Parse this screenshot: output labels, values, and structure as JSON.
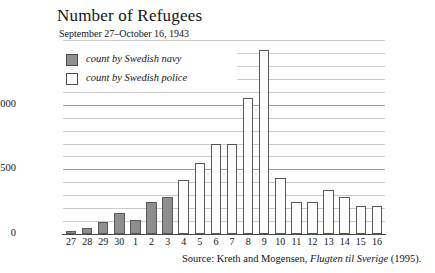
{
  "chart_data": {
    "type": "bar",
    "title": "Number of Refugees",
    "subtitle": "September 27–October 16, 1943",
    "xlabel": "",
    "ylabel": "",
    "ylim": [
      0,
      1500
    ],
    "ytick_values": [
      0,
      500,
      1000
    ],
    "ytick_labels": [
      "0",
      "500",
      "1000"
    ],
    "minor_gridline_step": 100,
    "grid": true,
    "legend_position": "top-left",
    "categories": [
      "27",
      "28",
      "29",
      "30",
      "1",
      "2",
      "3",
      "4",
      "5",
      "6",
      "7",
      "8",
      "9",
      "10",
      "11",
      "12",
      "13",
      "14",
      "15",
      "16"
    ],
    "series": [
      {
        "name": "count by Swedish navy",
        "color": "#8e8e8e",
        "values": [
          25,
          50,
          90,
          160,
          110,
          250,
          290,
          null,
          null,
          null,
          null,
          null,
          null,
          null,
          null,
          null,
          null,
          null,
          null,
          null
        ]
      },
      {
        "name": "count by Swedish police",
        "color": "#ffffff",
        "values": [
          null,
          null,
          null,
          null,
          null,
          null,
          null,
          420,
          550,
          700,
          700,
          1050,
          1420,
          430,
          250,
          250,
          340,
          290,
          220,
          220
        ]
      }
    ],
    "bars": [
      {
        "category": "27",
        "value": 25,
        "series": "count by Swedish navy"
      },
      {
        "category": "28",
        "value": 50,
        "series": "count by Swedish navy"
      },
      {
        "category": "29",
        "value": 90,
        "series": "count by Swedish navy"
      },
      {
        "category": "30",
        "value": 160,
        "series": "count by Swedish navy"
      },
      {
        "category": "1",
        "value": 110,
        "series": "count by Swedish navy"
      },
      {
        "category": "2",
        "value": 250,
        "series": "count by Swedish navy"
      },
      {
        "category": "3",
        "value": 290,
        "series": "count by Swedish navy"
      },
      {
        "category": "4",
        "value": 420,
        "series": "count by Swedish police"
      },
      {
        "category": "5",
        "value": 550,
        "series": "count by Swedish police"
      },
      {
        "category": "6",
        "value": 700,
        "series": "count by Swedish police"
      },
      {
        "category": "7",
        "value": 700,
        "series": "count by Swedish police"
      },
      {
        "category": "8",
        "value": 1050,
        "series": "count by Swedish police"
      },
      {
        "category": "9",
        "value": 1420,
        "series": "count by Swedish police"
      },
      {
        "category": "10",
        "value": 430,
        "series": "count by Swedish police"
      },
      {
        "category": "11",
        "value": 250,
        "series": "count by Swedish police"
      },
      {
        "category": "12",
        "value": 250,
        "series": "count by Swedish police"
      },
      {
        "category": "13",
        "value": 340,
        "series": "count by Swedish police"
      },
      {
        "category": "14",
        "value": 290,
        "series": "count by Swedish police"
      },
      {
        "category": "15",
        "value": 220,
        "series": "count by Swedish police"
      },
      {
        "category": "16",
        "value": 220,
        "series": "count by Swedish police"
      }
    ],
    "annotations": {
      "source_prefix": "Source: Kreth and Mogensen,",
      "source_work": "Flugten til Sverige",
      "source_suffix": "(1995)."
    }
  }
}
